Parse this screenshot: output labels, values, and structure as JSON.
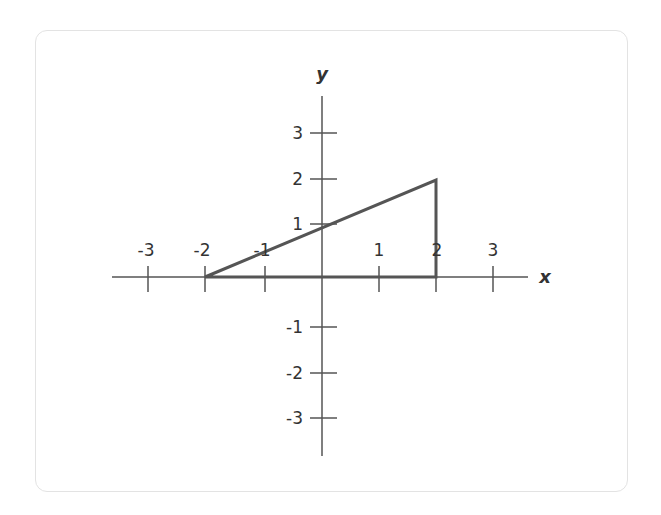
{
  "diagram": {
    "type": "coordinate-plane",
    "axes": {
      "x_label": "x",
      "y_label": "y",
      "x_ticks": [
        "-3",
        "-2",
        "-1",
        "1",
        "2",
        "3"
      ],
      "y_ticks": [
        "3",
        "2",
        "1",
        "-1",
        "-2",
        "-3"
      ]
    },
    "shape": {
      "kind": "triangle",
      "vertices": [
        [
          -2,
          0
        ],
        [
          2,
          0
        ],
        [
          2,
          2
        ]
      ],
      "stroke_color": "#555555"
    },
    "colors": {
      "axis": "#555555",
      "border": "#e3e3e3",
      "background": "#ffffff"
    }
  }
}
